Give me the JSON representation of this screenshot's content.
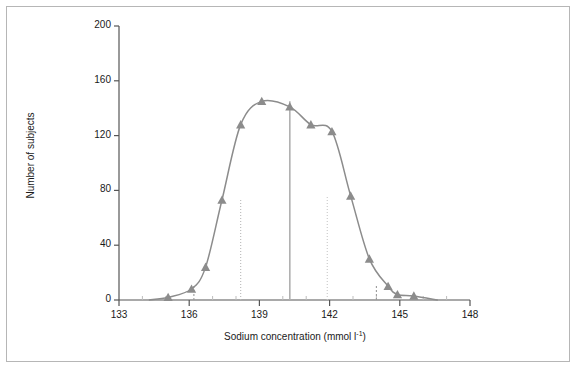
{
  "figure": {
    "border_color": "#b6b6b6",
    "background": "#ffffff"
  },
  "chart_data": {
    "type": "line",
    "title": "",
    "subtitle": "",
    "xlabel_text": "Sodium concentration (mmol l",
    "xlabel_sup": "-1",
    "xlabel_tail": ")",
    "ylabel": "Number of subjects",
    "xlim": [
      133,
      148
    ],
    "ylim": [
      0,
      200
    ],
    "xticks": [
      133,
      136,
      139,
      142,
      145,
      148
    ],
    "xtick_labels": [
      "133",
      "136",
      "139",
      "142",
      "145",
      "148"
    ],
    "xminor_ticks": [
      134,
      135,
      137,
      138,
      140,
      141,
      143,
      144,
      146,
      147
    ],
    "yticks": [
      0,
      40,
      80,
      120,
      160,
      200
    ],
    "ytick_labels": [
      "0",
      "40",
      "80",
      "120",
      "160",
      "200"
    ],
    "grid": false,
    "legend": null,
    "series": [
      {
        "name": "Sodium concentration distribution",
        "marker": "triangle-up",
        "marker_color": "#8c8c8c",
        "line_color": "#8c8c8c",
        "x": [
          135.1,
          136.1,
          136.7,
          137.4,
          138.2,
          139.1,
          140.3,
          141.2,
          142.1,
          142.9,
          143.7,
          144.5,
          144.9,
          145.6
        ],
        "y": [
          2,
          8,
          24,
          73,
          128,
          145,
          141,
          128,
          123,
          76,
          30,
          10,
          4,
          3
        ]
      }
    ],
    "annotations": {
      "mean_line": {
        "x": 140.3,
        "y_top": 145,
        "style": "solid",
        "color": "#b0b0b0"
      },
      "sd_lines": [
        {
          "x": 138.2,
          "y_top": 73,
          "style": "dotted",
          "color": "#b8b8b8"
        },
        {
          "x": 141.9,
          "y_top": 76,
          "style": "dotted",
          "color": "#c8c8c8"
        }
      ],
      "short_ticks": [
        {
          "x": 136.2,
          "y_top": 11,
          "color": "#9a9a9a"
        },
        {
          "x": 144.0,
          "y_top": 11,
          "color": "#9a9a9a"
        }
      ]
    }
  }
}
